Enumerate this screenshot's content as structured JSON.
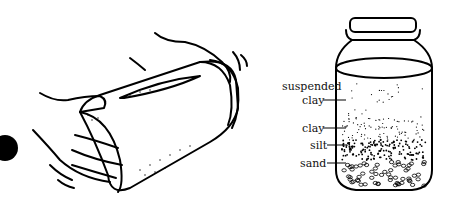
{
  "figure": {
    "left_panel": "hands shaking a jar of soil and water",
    "right_panel": "jar with settled soil layers"
  },
  "labels": [
    {
      "id": "suspended-clay",
      "text_line1": "suspended",
      "text_line2": "clay"
    },
    {
      "id": "clay",
      "text": "clay"
    },
    {
      "id": "silt",
      "text": "silt"
    },
    {
      "id": "sand",
      "text": "sand"
    }
  ],
  "colors": {
    "ink": "#000000",
    "background": "#ffffff"
  }
}
